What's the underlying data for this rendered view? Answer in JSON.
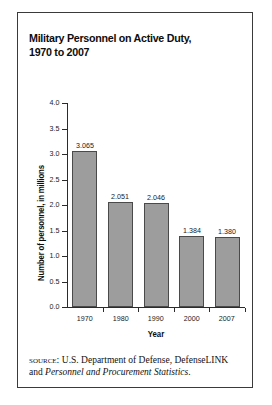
{
  "figure": {
    "title_line1": "Military Personnel on Active Duty,",
    "title_line2": "1970 to 2007",
    "source_label": "SOURCE:",
    "source_text_1": " U.S. Department of Defense, DefenseLINK and ",
    "source_text_italic": "Personnel and Procurement Statistics",
    "source_text_end": "."
  },
  "chart_data": {
    "type": "bar",
    "title": "Military Personnel on Active Duty, 1970 to 2007",
    "xlabel": "Year",
    "ylabel": "Number of personnel, in millions",
    "categories": [
      "1970",
      "1980",
      "1990",
      "2000",
      "2007"
    ],
    "values": [
      3.065,
      2.051,
      2.046,
      1.384,
      1.38
    ],
    "value_labels": [
      "3.065",
      "2.051",
      "2.046",
      "1.384",
      "1.380"
    ],
    "ylim": [
      0.0,
      4.0
    ],
    "ytick_step": 0.5,
    "ytick_labels": [
      "4.0",
      "3.5",
      "3.0",
      "2.5",
      "2.0",
      "1.5",
      "1.0",
      "0.5",
      "0.0"
    ],
    "ytick_values": [
      4.0,
      3.5,
      3.0,
      2.5,
      2.0,
      1.5,
      1.0,
      0.5,
      0.0
    ],
    "grid": false,
    "legend": false,
    "bar_color": "#9d9d9d",
    "bar_edge_color": "#4a4a4a",
    "axis_color": "#2b2b2b"
  }
}
